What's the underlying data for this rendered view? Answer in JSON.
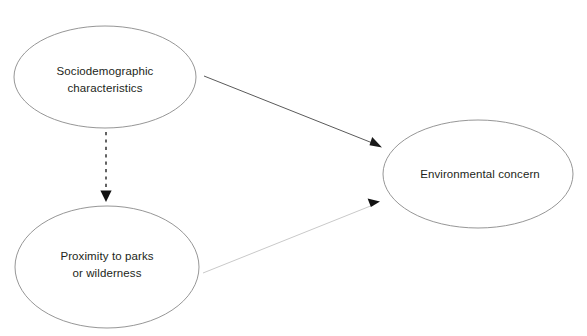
{
  "diagram": {
    "type": "path-diagram",
    "background_color": "#ffffff",
    "nodes": [
      {
        "id": "sociodemographic",
        "label_line1": "Sociodemographic",
        "label_line2": "characteristics",
        "shape": "ellipse",
        "cx": 105,
        "cy": 77,
        "rx": 91,
        "ry": 51,
        "stroke_color": "#8a8a8a",
        "fill_color": "#ffffff"
      },
      {
        "id": "proximity",
        "label_line1": "Proximity to parks",
        "label_line2": "or wilderness",
        "shape": "ellipse",
        "cx": 107,
        "cy": 267,
        "rx": 92,
        "ry": 61,
        "stroke_color": "#8a8a8a",
        "fill_color": "#ffffff"
      },
      {
        "id": "environmental_concern",
        "label_line1": "Environmental concern",
        "label_line2": "",
        "shape": "ellipse",
        "cx": 478,
        "cy": 174,
        "rx": 95,
        "ry": 54,
        "stroke_color": "#8a8a8a",
        "fill_color": "#ffffff"
      }
    ],
    "edges": [
      {
        "id": "socio-to-concern",
        "from": "sociodemographic",
        "to": "environmental_concern",
        "style": "solid",
        "color": "#5a5a5a",
        "arrowhead": "filled-triangle",
        "x1": 204,
        "y1": 76,
        "x2": 382,
        "y2": 147
      },
      {
        "id": "socio-to-proximity",
        "from": "sociodemographic",
        "to": "proximity",
        "style": "dashed",
        "color": "#3d3d3d",
        "arrowhead": "filled-triangle",
        "x1": 106,
        "y1": 131,
        "x2": 106,
        "y2": 202
      },
      {
        "id": "proximity-to-concern",
        "from": "proximity",
        "to": "environmental_concern",
        "style": "solid",
        "color": "#c9c9c9",
        "arrowhead": "filled-triangle",
        "x1": 203,
        "y1": 273,
        "x2": 380,
        "y2": 201
      }
    ]
  }
}
